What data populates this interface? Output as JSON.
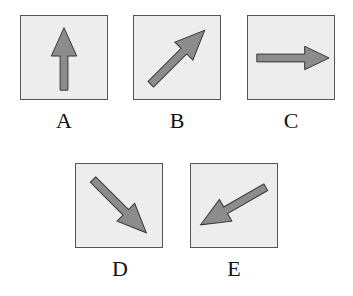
{
  "figure": {
    "options": [
      {
        "label": "A",
        "direction": "up",
        "icon": "arrow-up-icon"
      },
      {
        "label": "B",
        "direction": "up-right",
        "icon": "arrow-up-right-icon"
      },
      {
        "label": "C",
        "direction": "right",
        "icon": "arrow-right-icon"
      },
      {
        "label": "D",
        "direction": "down-right",
        "icon": "arrow-down-right-icon"
      },
      {
        "label": "E",
        "direction": "down-left",
        "icon": "arrow-down-left-icon"
      }
    ],
    "colors": {
      "box_fill": "#ededed",
      "box_border": "#555555",
      "arrow_fill": "#8c8c8c",
      "arrow_stroke": "#333333"
    }
  }
}
